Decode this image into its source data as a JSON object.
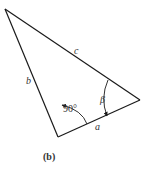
{
  "figure": {
    "panel_label": "(b)",
    "vertices": {
      "top": [
        5,
        9
      ],
      "right": [
        140,
        100
      ],
      "bottom": [
        58,
        137
      ]
    },
    "sides": {
      "a": "a",
      "b": "b",
      "c": "c"
    },
    "angles": {
      "right_angle": "90°",
      "beta": "β"
    },
    "colors": {
      "line": "#1a1a1a",
      "text": "#333333",
      "background": "#ffffff"
    }
  }
}
